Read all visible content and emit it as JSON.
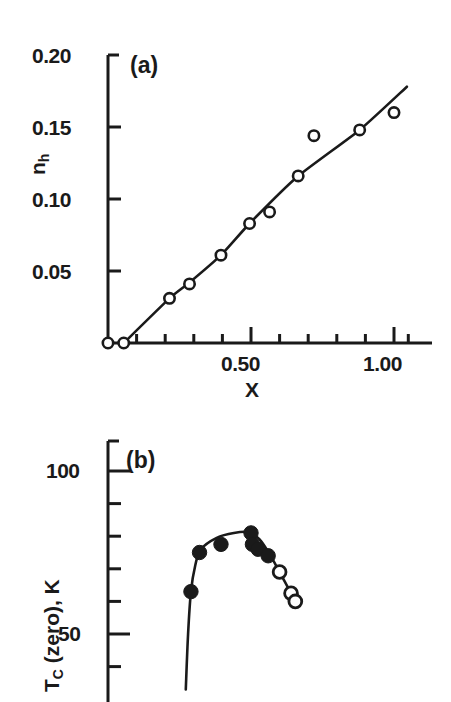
{
  "figure": {
    "background": "#ffffff",
    "ink": "#1a1a1a"
  },
  "panel_a": {
    "label": "(a)",
    "y_axis_title_main": "n",
    "y_axis_title_sub": "h",
    "x_axis_title": "X",
    "y_tick_labels": [
      "0.20",
      "0.15",
      "0.10",
      "0.05"
    ],
    "x_tick_labels": [
      "0.50",
      "1.00"
    ]
  },
  "panel_b": {
    "label": "(b)",
    "y_axis_title_main": "T",
    "y_axis_title_sub": "C",
    "y_axis_title_rest": " (zero), K",
    "y_tick_labels": [
      "100",
      "50"
    ]
  },
  "chart_data": [
    {
      "type": "scatter",
      "panel": "(a)",
      "title": "",
      "xlabel": "X",
      "ylabel": "n_h",
      "xlim": [
        0.0,
        1.05
      ],
      "ylim": [
        0.0,
        0.2
      ],
      "grid": false,
      "legend": "none",
      "x_major_ticks": [
        0.5,
        1.0
      ],
      "x_minor_ticks": [
        0.1,
        0.2,
        0.3,
        0.4,
        0.6,
        0.7,
        0.8,
        0.9,
        1.05
      ],
      "y_major_ticks": [
        0.05,
        0.1,
        0.15,
        0.2
      ],
      "marker_style": "open-circle",
      "series": [
        {
          "name": "n_h vs x (data)",
          "marker": "open-circle",
          "points": [
            {
              "x": 0.0,
              "y": 0.0
            },
            {
              "x": 0.055,
              "y": 0.0
            },
            {
              "x": 0.215,
              "y": 0.031
            },
            {
              "x": 0.285,
              "y": 0.041
            },
            {
              "x": 0.395,
              "y": 0.061
            },
            {
              "x": 0.495,
              "y": 0.083
            },
            {
              "x": 0.565,
              "y": 0.091
            },
            {
              "x": 0.665,
              "y": 0.116
            },
            {
              "x": 0.72,
              "y": 0.144
            },
            {
              "x": 0.88,
              "y": 0.148
            },
            {
              "x": 1.0,
              "y": 0.16
            }
          ]
        },
        {
          "name": "fitted line",
          "marker": "none",
          "line": true,
          "points": [
            {
              "x": 0.055,
              "y": 0.0
            },
            {
              "x": 0.215,
              "y": 0.031
            },
            {
              "x": 0.285,
              "y": 0.042
            },
            {
              "x": 0.395,
              "y": 0.061
            },
            {
              "x": 0.495,
              "y": 0.083
            },
            {
              "x": 0.665,
              "y": 0.116
            },
            {
              "x": 0.88,
              "y": 0.148
            },
            {
              "x": 1.045,
              "y": 0.178
            }
          ]
        }
      ]
    },
    {
      "type": "scatter",
      "panel": "(b)",
      "title": "",
      "xlabel": "",
      "ylabel": "T_C (zero), K",
      "xlim": [
        0.0,
        1.05
      ],
      "ylim": [
        30,
        110
      ],
      "grid": false,
      "legend": "none",
      "y_major_ticks": [
        50,
        100
      ],
      "y_minor_ticks": [
        40,
        60,
        70,
        80,
        90,
        110
      ],
      "note": "x-axis is cropped off the bottom of the screenshot",
      "series": [
        {
          "name": "T_C filled markers",
          "marker": "filled-circle",
          "points": [
            {
              "x": 0.29,
              "y": 63.0
            },
            {
              "x": 0.32,
              "y": 75.0
            },
            {
              "x": 0.395,
              "y": 77.5
            },
            {
              "x": 0.5,
              "y": 81.0
            },
            {
              "x": 0.505,
              "y": 77.5
            },
            {
              "x": 0.525,
              "y": 76.0
            },
            {
              "x": 0.56,
              "y": 74.0
            }
          ]
        },
        {
          "name": "T_C open markers",
          "marker": "open-circle",
          "points": [
            {
              "x": 0.6,
              "y": 69.0
            },
            {
              "x": 0.64,
              "y": 62.5
            },
            {
              "x": 0.655,
              "y": 60.0
            }
          ]
        },
        {
          "name": "guide curve",
          "marker": "none",
          "line": true,
          "points": [
            {
              "x": 0.272,
              "y": 33.0
            },
            {
              "x": 0.28,
              "y": 50.0
            },
            {
              "x": 0.29,
              "y": 63.0
            },
            {
              "x": 0.305,
              "y": 71.0
            },
            {
              "x": 0.325,
              "y": 76.0
            },
            {
              "x": 0.38,
              "y": 79.5
            },
            {
              "x": 0.44,
              "y": 81.0
            },
            {
              "x": 0.495,
              "y": 81.2
            },
            {
              "x": 0.53,
              "y": 79.0
            },
            {
              "x": 0.565,
              "y": 74.5
            },
            {
              "x": 0.6,
              "y": 69.0
            },
            {
              "x": 0.64,
              "y": 62.5
            },
            {
              "x": 0.655,
              "y": 60.0
            }
          ]
        }
      ]
    }
  ]
}
